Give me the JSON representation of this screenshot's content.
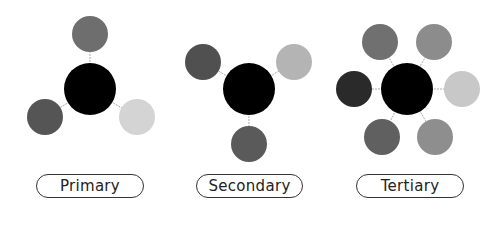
{
  "groups": [
    {
      "label": "Primary",
      "center": {
        "x": 90,
        "y": 89,
        "r": 26,
        "color": "#000000"
      },
      "satellites": [
        {
          "x": 90,
          "y": 34,
          "r": 18,
          "color": "#6e6e6e"
        },
        {
          "x": 45,
          "y": 117,
          "r": 18,
          "color": "#555555"
        },
        {
          "x": 137,
          "y": 117,
          "r": 18,
          "color": "#d4d4d4"
        }
      ]
    },
    {
      "label": "Secondary",
      "center": {
        "x": 249,
        "y": 89,
        "r": 26,
        "color": "#000000"
      },
      "satellites": [
        {
          "x": 203,
          "y": 62,
          "r": 18,
          "color": "#505050"
        },
        {
          "x": 294,
          "y": 62,
          "r": 18,
          "color": "#b4b4b4"
        },
        {
          "x": 249,
          "y": 144,
          "r": 18,
          "color": "#5a5a5a"
        }
      ]
    },
    {
      "label": "Tertiary",
      "center": {
        "x": 407,
        "y": 89,
        "r": 26,
        "color": "#000000"
      },
      "satellites": [
        {
          "x": 380,
          "y": 42,
          "r": 18,
          "color": "#707070"
        },
        {
          "x": 434,
          "y": 42,
          "r": 18,
          "color": "#8c8c8c"
        },
        {
          "x": 354,
          "y": 89,
          "r": 18,
          "color": "#2a2a2a"
        },
        {
          "x": 462,
          "y": 89,
          "r": 18,
          "color": "#c8c8c8"
        },
        {
          "x": 382,
          "y": 137,
          "r": 18,
          "color": "#606060"
        },
        {
          "x": 435,
          "y": 137,
          "r": 18,
          "color": "#8e8e8e"
        }
      ]
    }
  ],
  "labels": {
    "primary": "Primary",
    "secondary": "Secondary",
    "tertiary": "Tertiary"
  }
}
